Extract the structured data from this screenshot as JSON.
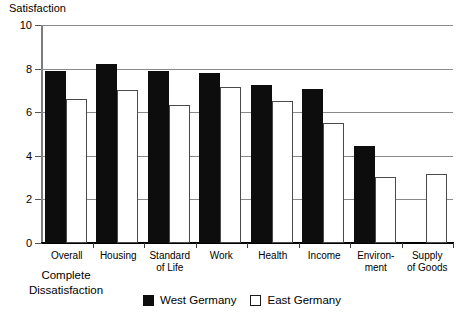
{
  "chart_data": {
    "type": "bar",
    "title": "",
    "xlabel": "",
    "ylabel": "Satisfaction",
    "ylim": [
      0,
      10
    ],
    "yticks": [
      0,
      2,
      4,
      6,
      8,
      10
    ],
    "grid": true,
    "legend_position": "bottom-center",
    "corner_note": "Complete\nDissatisfaction",
    "corner_note_line1": "Complete",
    "corner_note_line2": "Dissatisfaction",
    "categories": [
      "Overall",
      "Housing",
      "Standard\nof Life",
      "Work",
      "Health",
      "Income",
      "Environ-\nment",
      "Supply\nof Goods"
    ],
    "series": [
      {
        "name": "West Germany",
        "color": "#0d0d0d",
        "values": [
          7.9,
          8.2,
          7.9,
          7.8,
          7.25,
          7.05,
          4.45,
          null
        ]
      },
      {
        "name": "East Germany",
        "color": "#ffffff",
        "values": [
          6.6,
          7.0,
          6.35,
          7.15,
          6.5,
          5.5,
          3.05,
          3.15
        ]
      }
    ]
  },
  "axis": {
    "y_title": "Satisfaction",
    "tick_labels": [
      "10",
      "8",
      "6",
      "4",
      "2",
      "0"
    ]
  },
  "legend": {
    "items": [
      {
        "label": "West Germany",
        "swatch": "filled-black-square"
      },
      {
        "label": "East Germany",
        "swatch": "outlined-white-square"
      }
    ]
  }
}
